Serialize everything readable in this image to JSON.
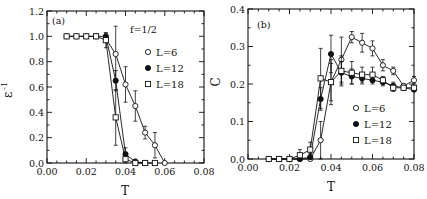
{
  "chart_data": [
    {
      "type": "line",
      "panel_label": "(a)",
      "annotation": "f=1/2",
      "xlabel": "T",
      "ylabel": "ε -1",
      "xlim": [
        0.0,
        0.08
      ],
      "ylim": [
        0.0,
        1.2
      ],
      "xticks": [
        "0.00",
        "0.02",
        "0.04",
        "0.06",
        "0.08"
      ],
      "yticks": [
        "0.0",
        "0.2",
        "0.4",
        "0.6",
        "0.8",
        "1.0",
        "1.2"
      ],
      "grid": false,
      "legend_position": "upper right",
      "series": [
        {
          "name": "L=6",
          "marker": "open-circle",
          "x": [
            0.03,
            0.035,
            0.04,
            0.045,
            0.05,
            0.055,
            0.06
          ],
          "y": [
            0.98,
            0.86,
            0.62,
            0.45,
            0.24,
            0.14,
            0.0
          ],
          "err": [
            0.02,
            0.22,
            0.14,
            0.12,
            0.05,
            0.1,
            0.0
          ]
        },
        {
          "name": "L=12",
          "marker": "filled-circle",
          "x": [
            0.01,
            0.015,
            0.02,
            0.025,
            0.03,
            0.035,
            0.04,
            0.045,
            0.05
          ],
          "y": [
            1.0,
            1.0,
            1.0,
            1.0,
            1.0,
            0.65,
            0.07,
            0.01,
            0.0
          ],
          "err": [
            0,
            0,
            0,
            0,
            0.02,
            0.08,
            0.05,
            0.02,
            0.0
          ]
        },
        {
          "name": "L=18",
          "marker": "open-square",
          "x": [
            0.01,
            0.015,
            0.02,
            0.025,
            0.03,
            0.035,
            0.04,
            0.045,
            0.05,
            0.055
          ],
          "y": [
            1.0,
            1.0,
            1.0,
            1.0,
            0.97,
            0.36,
            0.03,
            0.0,
            0.0,
            0.0
          ],
          "err": [
            0,
            0,
            0,
            0,
            0.06,
            0.22,
            0.04,
            0.0,
            0.0,
            0.0
          ]
        }
      ]
    },
    {
      "type": "line",
      "panel_label": "(b)",
      "xlabel": "T",
      "ylabel": "C",
      "xlim": [
        0.0,
        0.08
      ],
      "ylim": [
        0.0,
        0.4
      ],
      "xticks": [
        "0.00",
        "0.02",
        "0.04",
        "0.06",
        "0.08"
      ],
      "yticks": [
        "0.0",
        "0.1",
        "0.2",
        "0.3",
        "0.4"
      ],
      "grid": false,
      "legend_position": "lower right",
      "series": [
        {
          "name": "L=6",
          "marker": "open-circle",
          "x": [
            0.01,
            0.015,
            0.02,
            0.025,
            0.03,
            0.035,
            0.04,
            0.045,
            0.05,
            0.055,
            0.06,
            0.065,
            0.07,
            0.075,
            0.08
          ],
          "y": [
            0.0,
            0.0,
            0.0,
            0.0,
            0.0,
            0.05,
            0.205,
            0.265,
            0.325,
            0.31,
            0.295,
            0.25,
            0.235,
            0.195,
            0.21
          ],
          "err": [
            0,
            0,
            0,
            0,
            0.01,
            0.05,
            0.06,
            0.06,
            0.015,
            0.025,
            0.02,
            0.015,
            0.01,
            0.005,
            0.01
          ]
        },
        {
          "name": "L=12",
          "marker": "filled-circle",
          "x": [
            0.01,
            0.015,
            0.02,
            0.025,
            0.03,
            0.035,
            0.04,
            0.045,
            0.05,
            0.055,
            0.06,
            0.065,
            0.07,
            0.075,
            0.08
          ],
          "y": [
            0.0,
            0.0,
            0.0,
            0.0,
            0.005,
            0.16,
            0.28,
            0.23,
            0.22,
            0.215,
            0.21,
            0.205,
            0.195,
            0.19,
            0.185
          ],
          "err": [
            0,
            0,
            0,
            0,
            0.01,
            0.03,
            0.05,
            0.03,
            0.02,
            0.015,
            0.01,
            0.01,
            0.01,
            0.005,
            0.005
          ]
        },
        {
          "name": "L=18",
          "marker": "open-square",
          "x": [
            0.01,
            0.015,
            0.02,
            0.025,
            0.03,
            0.035,
            0.04,
            0.045,
            0.05,
            0.055,
            0.06,
            0.065,
            0.07,
            0.075,
            0.08
          ],
          "y": [
            0.0,
            0.0,
            0.0,
            0.01,
            0.025,
            0.215,
            0.205,
            0.235,
            0.23,
            0.225,
            0.225,
            0.21,
            0.19,
            0.19,
            0.19
          ],
          "err": [
            0,
            0,
            0,
            0.015,
            0.02,
            0.08,
            0.05,
            0.04,
            0.03,
            0.02,
            0.02,
            0.01,
            0.01,
            0.005,
            0.005
          ]
        }
      ]
    }
  ]
}
